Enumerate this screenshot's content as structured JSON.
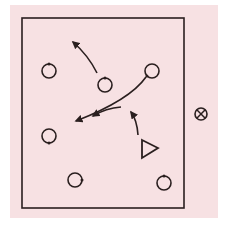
{
  "diagram": {
    "title": "",
    "colors": {
      "page_background": "#ffffff",
      "panel_background": "#f7e1e3",
      "ink": "#2a1f1f"
    },
    "panel": {
      "x": 10,
      "y": 5,
      "w": 208,
      "h": 213
    },
    "field": {
      "x": 22,
      "y": 18,
      "w": 162,
      "h": 190
    },
    "players": [
      {
        "id": "player-top-left",
        "shape": "circle",
        "cx": 49,
        "cy": 71,
        "r": 7,
        "tick": "top"
      },
      {
        "id": "player-top-center",
        "shape": "circle",
        "cx": 105,
        "cy": 85,
        "r": 7,
        "tick": "top"
      },
      {
        "id": "player-top-right",
        "shape": "circle",
        "cx": 152,
        "cy": 71,
        "r": 7,
        "tick": "bottom-left"
      },
      {
        "id": "player-middle-left",
        "shape": "circle",
        "cx": 49,
        "cy": 136,
        "r": 7,
        "tick": "bottom"
      },
      {
        "id": "player-bottom-left",
        "shape": "circle",
        "cx": 75,
        "cy": 180,
        "r": 7,
        "tick": "right"
      },
      {
        "id": "player-bottom-right",
        "shape": "circle",
        "cx": 164,
        "cy": 183,
        "r": 7,
        "tick": "top"
      }
    ],
    "triangle": {
      "id": "coach-triangle",
      "points": "142,140 158,148 142,158"
    },
    "ball_marker": {
      "id": "ball-marker",
      "symbol": "⊗",
      "cx": 201,
      "cy": 114,
      "r": 6
    },
    "arrows": [
      {
        "id": "run-top-center",
        "d": "M 97 73 Q 88 55 73 42"
      },
      {
        "id": "pass-top-right",
        "d": "M 146 77 Q 130 100 76 121"
      },
      {
        "id": "run-center",
        "d": "M 121 107 Q 106 108 93 116"
      },
      {
        "id": "run-triangle",
        "d": "M 138 135 Q 137 120 131 112"
      }
    ]
  }
}
